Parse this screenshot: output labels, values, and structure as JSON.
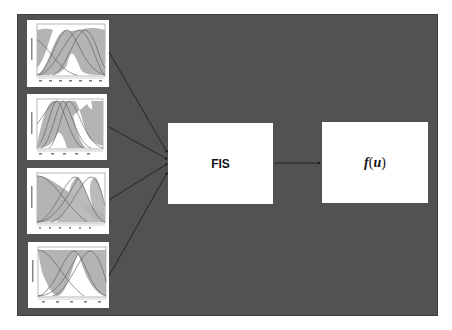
{
  "diagram": {
    "background_color": "#525252",
    "nodes": {
      "inputs": [
        {
          "id": "mf-plot-1",
          "type": "membership-function-plot",
          "count_curves": 3
        },
        {
          "id": "mf-plot-2",
          "type": "membership-function-plot",
          "count_curves": 3
        },
        {
          "id": "mf-plot-3",
          "type": "membership-function-plot",
          "count_curves": 3
        },
        {
          "id": "mf-plot-4",
          "type": "membership-function-plot",
          "count_curves": 3
        }
      ],
      "fis": {
        "label": "FIS"
      },
      "output": {
        "func": "f",
        "open": "(",
        "arg": "u",
        "close": ")"
      }
    },
    "edges": [
      {
        "from": "mf-plot-1",
        "to": "fis"
      },
      {
        "from": "mf-plot-2",
        "to": "fis"
      },
      {
        "from": "mf-plot-3",
        "to": "fis"
      },
      {
        "from": "mf-plot-4",
        "to": "fis"
      },
      {
        "from": "fis",
        "to": "output"
      }
    ]
  }
}
